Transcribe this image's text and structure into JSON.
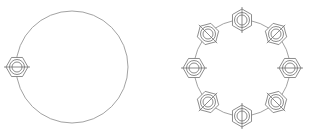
{
  "drawing": {
    "title": "Bolt Circle Pattern",
    "background_color": "#ffffff",
    "line_color": "#6e6e6e",
    "guide_color": "#8a8a8a",
    "canvas": {
      "width": 310,
      "height": 138
    },
    "figures": [
      {
        "name": "single-bolt-circle",
        "label": "Left figure: large circle with one hex nut",
        "circle": {
          "cx": 72,
          "cy": 67,
          "r": 56
        },
        "nut_count": 1,
        "nuts": [
          {
            "cx": 17,
            "cy": 67,
            "angle_deg": 180,
            "hex_r": 11,
            "ring_outer_r": 7.5,
            "ring_inner_r": 5.0,
            "centerline_len": 26
          }
        ]
      },
      {
        "name": "eight-bolt-circle",
        "label": "Right figure: bolt circle with eight hex nuts",
        "circle": {
          "cx": 242,
          "cy": 68,
          "r": 48
        },
        "nut_count": 8,
        "nuts": [
          {
            "cx": 242,
            "cy": 20,
            "angle_deg": 270,
            "hex_r": 11,
            "ring_outer_r": 7.5,
            "ring_inner_r": 5.0,
            "centerline_len": 26
          },
          {
            "cx": 276,
            "cy": 34,
            "angle_deg": 315,
            "hex_r": 11,
            "ring_outer_r": 7.5,
            "ring_inner_r": 5.0,
            "centerline_len": 26
          },
          {
            "cx": 290,
            "cy": 68,
            "angle_deg": 0,
            "hex_r": 11,
            "ring_outer_r": 7.5,
            "ring_inner_r": 5.0,
            "centerline_len": 26
          },
          {
            "cx": 276,
            "cy": 102,
            "angle_deg": 45,
            "hex_r": 11,
            "ring_outer_r": 7.5,
            "ring_inner_r": 5.0,
            "centerline_len": 26
          },
          {
            "cx": 242,
            "cy": 116,
            "angle_deg": 90,
            "hex_r": 11,
            "ring_outer_r": 7.5,
            "ring_inner_r": 5.0,
            "centerline_len": 26
          },
          {
            "cx": 208,
            "cy": 102,
            "angle_deg": 135,
            "hex_r": 11,
            "ring_outer_r": 7.5,
            "ring_inner_r": 5.0,
            "centerline_len": 26
          },
          {
            "cx": 194,
            "cy": 68,
            "angle_deg": 180,
            "hex_r": 11,
            "ring_outer_r": 7.5,
            "ring_inner_r": 5.0,
            "centerline_len": 26
          },
          {
            "cx": 208,
            "cy": 34,
            "angle_deg": 225,
            "hex_r": 11,
            "ring_outer_r": 7.5,
            "ring_inner_r": 5.0,
            "centerline_len": 26
          }
        ]
      }
    ]
  }
}
